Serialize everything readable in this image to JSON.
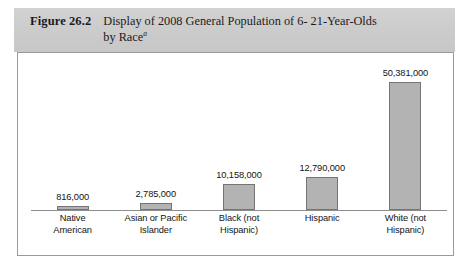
{
  "figure": {
    "number_label": "Figure 26.2",
    "title_line1": "Display of 2008 General Population of 6- 21-Year-Olds",
    "title_line2": "by Race",
    "title_footnote_marker": "a"
  },
  "chart_data": {
    "type": "bar",
    "xlabel": "",
    "ylabel": "",
    "grid": false,
    "legend": "none",
    "axis_visible": "x-baseline-only",
    "ylim": [
      0,
      55000000
    ],
    "categories": [
      "Native American",
      "Asian or Pacific Islander",
      "Black (not Hispanic)",
      "Hispanic",
      "White (not Hispanic)"
    ],
    "category_lines": [
      [
        "Native",
        "American"
      ],
      [
        "Asian or Pacific",
        "Islander"
      ],
      [
        "Black (not",
        "Hispanic)"
      ],
      [
        "Hispanic",
        ""
      ],
      [
        "White (not",
        "Hispanic)"
      ]
    ],
    "values": [
      816000,
      2785000,
      10158000,
      12790000,
      50381000
    ],
    "value_labels": [
      "816,000",
      "2,785,000",
      "10,158,000",
      "12,790,000",
      "50,381,000"
    ],
    "bar_color": "#b3b3b3",
    "bar_border_color": "#757575"
  },
  "colors": {
    "caption_band": "#cfcfcf",
    "frame_border": "#9a9a9a",
    "axis": "#8d8d8d",
    "text": "#141414"
  }
}
